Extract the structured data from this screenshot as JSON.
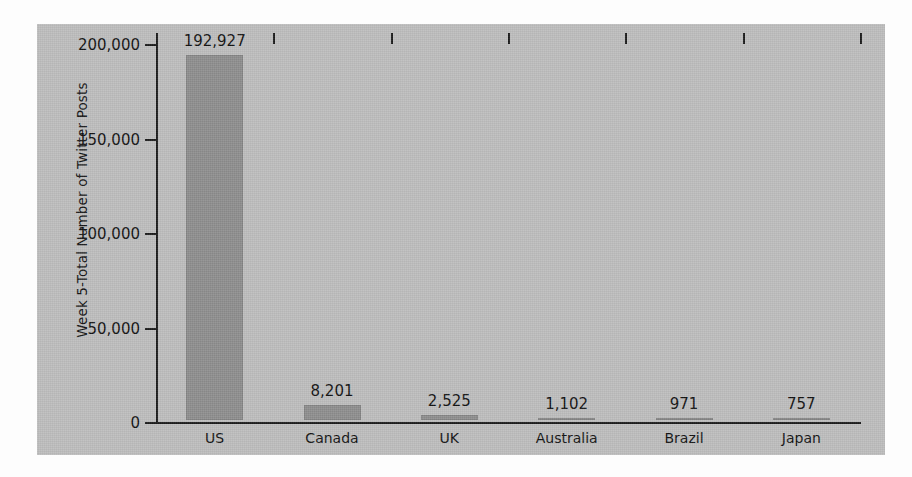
{
  "chart_data": {
    "type": "bar",
    "title": "",
    "subtitle": "",
    "xlabel": "",
    "ylabel": "Week 5-Total Number of Twitter Posts",
    "categories": [
      "US",
      "Canada",
      "UK",
      "Australia",
      "Brazil",
      "Japan"
    ],
    "values": [
      192927,
      8201,
      2525,
      1102,
      971,
      757
    ],
    "value_labels": [
      "192,927",
      "8,201",
      "2,525",
      "1,102",
      "971",
      "757"
    ],
    "ylim": [
      0,
      200000
    ],
    "ytick_values": [
      0,
      50000,
      100000,
      150000,
      200000
    ],
    "ytick_labels": [
      "0",
      "50,000",
      "100,000",
      "150,000",
      "200,000"
    ],
    "grid": false,
    "legend": null,
    "legend_position": "none",
    "series": [
      {
        "name": "Week 5-Total Number of Twitter Posts",
        "values": [
          192927,
          8201,
          2525,
          1102,
          971,
          757
        ]
      }
    ],
    "annotations": []
  },
  "style": {
    "panel_background": "#bdbdbd",
    "page_background": "#fdfdfd",
    "bar_color": "#8d8d8d",
    "axis_color": "#1b1b1b",
    "text_color": "#111111"
  }
}
